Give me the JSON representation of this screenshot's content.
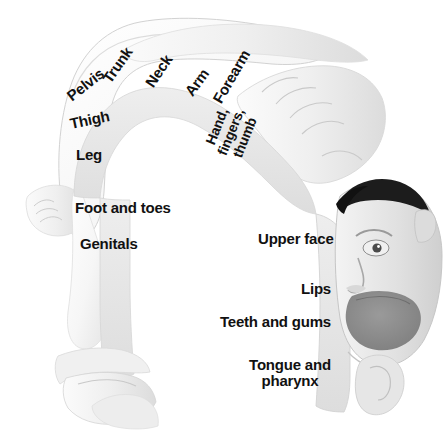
{
  "figure": {
    "background_color": "#ffffff",
    "text_color": "#111111",
    "band_color": "#e8e8e8",
    "body_color": "#f2f2f2",
    "mouth_color": "#8a8a8a",
    "hair_color": "#1c1c1c",
    "width": 448,
    "height": 437
  },
  "labels": {
    "pelvis": "Pelvis",
    "trunk": "Trunk",
    "neck": "Neck",
    "arm": "Arm",
    "forearm": "Forearm",
    "hand_fingers_thumb_line1": "Hand,",
    "hand_fingers_thumb_line2": "fingers,",
    "hand_fingers_thumb_line3": "thumb",
    "thigh": "Thigh",
    "leg": "Leg",
    "foot_and_toes": "Foot and toes",
    "genitals": "Genitals",
    "upper_face": "Upper face",
    "lips": "Lips",
    "teeth_and_gums": "Teeth and gums",
    "tongue_and_pharynx_line1": "Tongue and",
    "tongue_and_pharynx_line2": "pharynx"
  }
}
